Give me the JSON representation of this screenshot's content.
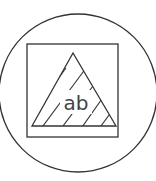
{
  "icon": {
    "name": "text-in-shape-icon",
    "label": "ab",
    "stroke_color": "#333333",
    "background": "#ffffff"
  }
}
